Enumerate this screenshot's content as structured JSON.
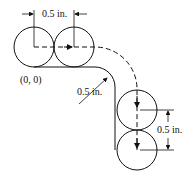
{
  "diagram": {
    "labels": {
      "top_dimension": "0.5 in.",
      "origin": "(0, 0)",
      "radius": "0.5 in.",
      "right_dimension": "0.5 in."
    },
    "colors": {
      "stroke": "#111111",
      "background": "#ffffff"
    }
  }
}
